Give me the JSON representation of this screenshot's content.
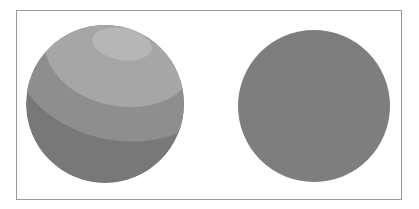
{
  "figure": {
    "spheres": [
      {
        "id": "banded",
        "cx": 105,
        "cy": 104,
        "r": 79,
        "bands": [
          {
            "name": "dark",
            "color": "#787878"
          },
          {
            "name": "mid",
            "color": "#8e8e8e",
            "ellipse": {
              "cx": 118,
              "cy": 66,
              "rx": 104,
              "ry": 74,
              "rotate": 12
            }
          },
          {
            "name": "light",
            "color": "#a6a6a6",
            "ellipse": {
              "cx": 120,
              "cy": 52,
              "rx": 76,
              "ry": 54,
              "rotate": 12
            }
          },
          {
            "name": "highlight",
            "color": "#b6b6b6",
            "ellipse": {
              "cx": 122,
              "cy": 44,
              "rx": 30,
              "ry": 16,
              "rotate": 10
            }
          }
        ]
      },
      {
        "id": "flat",
        "cx": 314,
        "cy": 106,
        "r": 76,
        "color": "#7e7e7e"
      }
    ],
    "frame_color": "#9a9a9a"
  }
}
